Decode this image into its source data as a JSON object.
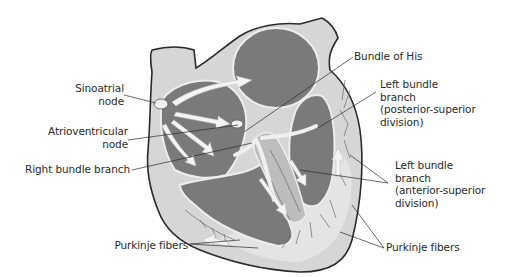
{
  "diagram": {
    "colors": {
      "chamber": "#7a7a7a",
      "wall": "#d6d6d6",
      "wall_light": "#e6e6e6",
      "outline": "#2a2a2a",
      "arrow": "#f2f2f2",
      "label_text": "#2a2a2a",
      "background": "#ffffff"
    },
    "labels": {
      "sinoatrial": [
        "Sinoatrial",
        "node"
      ],
      "atrioventricular": [
        "Atrioventricular",
        "node"
      ],
      "right_bundle": [
        "Right bundle branch"
      ],
      "purkinje_left": [
        "Purkinje fibers"
      ],
      "bundle_of_his": [
        "Bundle of His"
      ],
      "left_bundle_posterior": [
        "Left bundle",
        "branch",
        "(posterior-superior",
        "division)"
      ],
      "left_bundle_anterior": [
        "Left bundle",
        "branch",
        "(anterior-superior",
        "division)"
      ],
      "purkinje_right": [
        "Purkinje fibers"
      ]
    }
  }
}
